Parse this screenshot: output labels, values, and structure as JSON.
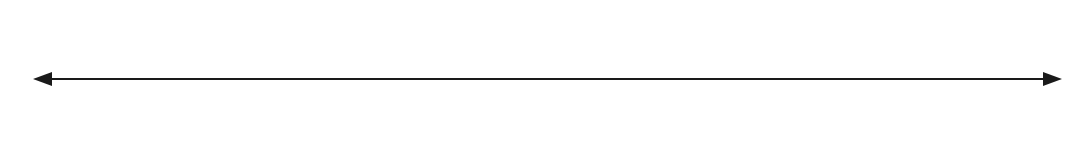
{
  "diagram": {
    "type": "number_line",
    "range": [
      0,
      4
    ],
    "step": "1/4",
    "line_color": "#1a1a1a",
    "arrows": [
      "left",
      "right"
    ],
    "top_labels": [
      {
        "pos": 0,
        "whole": "0"
      },
      {
        "pos": 4,
        "whole": "1"
      },
      {
        "pos": 6,
        "whole": "1",
        "num": "1",
        "den": "2"
      },
      {
        "pos": 8,
        "whole": "2"
      },
      {
        "pos": 10,
        "whole": "2",
        "num": "1",
        "den": "2"
      },
      {
        "pos": 12,
        "whole": "3"
      },
      {
        "pos": 14,
        "whole": "3",
        "num": "1",
        "den": "2"
      },
      {
        "pos": 15,
        "whole": "3",
        "num": "3",
        "den": "4"
      },
      {
        "pos": 16,
        "whole": "4"
      }
    ],
    "bottom_labels": [
      {
        "pos": 0,
        "text": "0"
      },
      {
        "pos": 1,
        "num": "1",
        "den": "4"
      },
      {
        "pos": 2,
        "num": "2",
        "den": "4"
      },
      {
        "pos": 3,
        "num": "3",
        "den": "4"
      },
      {
        "pos": 4,
        "num": "4",
        "den": "4"
      },
      {
        "pos": 5,
        "num": "5",
        "den": "4"
      },
      {
        "pos": 6,
        "num": "6",
        "den": "4"
      },
      {
        "pos": 7,
        "num": "7",
        "den": "4"
      },
      {
        "pos": 8,
        "num": "8",
        "den": "4"
      },
      {
        "pos": 9,
        "num": "9",
        "den": "4"
      },
      {
        "pos": 10,
        "num": "10",
        "den": "4"
      },
      {
        "pos": 11,
        "num": "11",
        "den": "4"
      },
      {
        "pos": 12,
        "num": "12",
        "den": "4"
      },
      {
        "pos": 13,
        "num": "13",
        "den": "4"
      },
      {
        "pos": 14,
        "num": "14",
        "den": "4"
      },
      {
        "pos": 15,
        "text": "?"
      },
      {
        "pos": 16,
        "num": "16",
        "den": "4"
      }
    ],
    "long_ticks": [
      0,
      2,
      4,
      8,
      12,
      16
    ]
  }
}
